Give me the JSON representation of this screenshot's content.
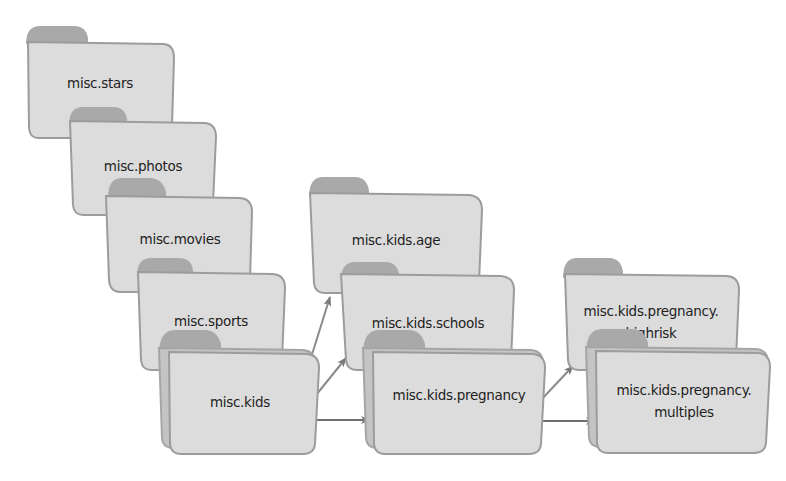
{
  "diagram": {
    "type": "newsgroup-hierarchy",
    "colors": {
      "folder_fill": "#dcdcdc",
      "folder_stroke": "#9c9c9c",
      "folder_tab": "#a9a9a9",
      "folder_back": "#c4c4c4",
      "arrow": "#7a7a7a",
      "text": "#1e1e1e"
    },
    "folders": [
      {
        "id": "misc-stars",
        "label_lines": [
          "misc.stars"
        ],
        "stacked": false
      },
      {
        "id": "misc-photos",
        "label_lines": [
          "misc.photos"
        ],
        "stacked": false
      },
      {
        "id": "misc-movies",
        "label_lines": [
          "misc.movies"
        ],
        "stacked": false
      },
      {
        "id": "misc-sports",
        "label_lines": [
          "misc.sports"
        ],
        "stacked": false
      },
      {
        "id": "misc-kids",
        "label_lines": [
          "misc.kids"
        ],
        "stacked": true
      },
      {
        "id": "misc-kids-age",
        "label_lines": [
          "misc.kids.age"
        ],
        "stacked": false
      },
      {
        "id": "misc-kids-schools",
        "label_lines": [
          "misc.kids.schools"
        ],
        "stacked": false
      },
      {
        "id": "misc-kids-pregnancy",
        "label_lines": [
          "misc.kids.pregnancy"
        ],
        "stacked": true
      },
      {
        "id": "misc-kids-pregnancy-highrisk",
        "label_lines": [
          "misc.kids.pregnancy.",
          "highrisk"
        ],
        "stacked": false
      },
      {
        "id": "misc-kids-pregnancy-multiples",
        "label_lines": [
          "misc.kids.pregnancy.",
          "multiples"
        ],
        "stacked": true
      }
    ],
    "edges": [
      {
        "from": "misc.kids",
        "to": "misc.kids.age"
      },
      {
        "from": "misc.kids",
        "to": "misc.kids.schools"
      },
      {
        "from": "misc.kids",
        "to": "misc.kids.pregnancy"
      },
      {
        "from": "misc.kids.pregnancy",
        "to": "misc.kids.pregnancy.highrisk"
      },
      {
        "from": "misc.kids.pregnancy",
        "to": "misc.kids.pregnancy.multiples"
      }
    ]
  }
}
